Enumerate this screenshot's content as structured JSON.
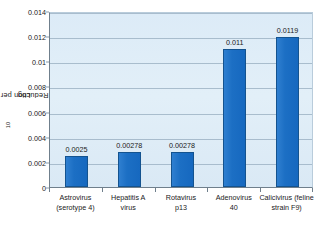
{
  "chart_data": {
    "type": "bar",
    "title": "",
    "xlabel": "",
    "ylabel": "Log10 Reduction per hour",
    "ylabel_base": "Log",
    "ylabel_sub": "10",
    "ylabel_rest": " Reduction per hour",
    "categories": [
      "Astrovirus (serotype 4)",
      "Hepatitis A virus",
      "Rotavirus p13",
      "Adenovirus 40",
      "Calicivirus (feline strain F9)"
    ],
    "category_lines": [
      [
        "Astrovirus",
        "(serotype 4)"
      ],
      [
        "Hepatitis A",
        "virus"
      ],
      [
        "Rotavirus",
        "p13"
      ],
      [
        "Adenovirus",
        "40"
      ],
      [
        "Calicivirus (feline",
        "strain F9)"
      ]
    ],
    "values": [
      0.0025,
      0.00278,
      0.00278,
      0.011,
      0.0119
    ],
    "value_labels": [
      "0.0025",
      "0.00278",
      "0.00278",
      "0.011",
      "0.0119"
    ],
    "ylim": [
      0,
      0.014
    ],
    "yticks": [
      0,
      0.002,
      0.004,
      0.006,
      0.008,
      0.01,
      0.012,
      0.014
    ],
    "ytick_labels": [
      "0",
      "0.002",
      "0.004",
      "0.006",
      "0.008",
      "0.01",
      "0.012",
      "0.014"
    ],
    "grid": true,
    "grid_axis": "y",
    "legend": false,
    "legend_position": "none",
    "bar_color": "#1c6fc4",
    "bar_edge_color": "#14538f",
    "plot_background": "#dcebf7",
    "gridline_color": "#9fb4c6",
    "axis_color": "#6f7f8c",
    "figure_background": "#ffffff",
    "text_color": "#1a1a1a"
  }
}
